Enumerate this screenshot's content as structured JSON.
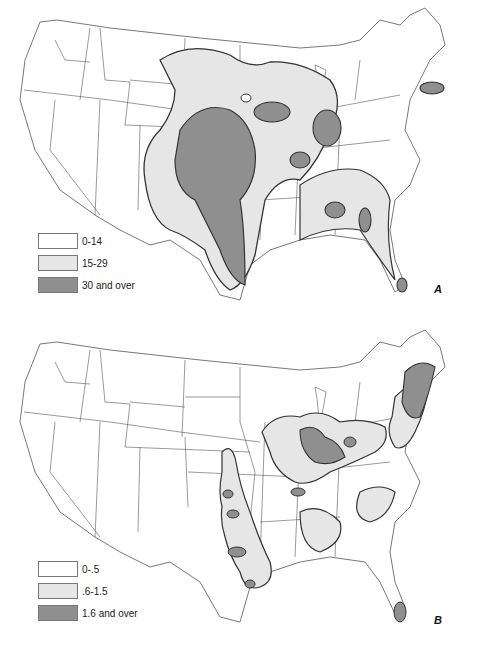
{
  "colors": {
    "low": "#ffffff",
    "mid": "#e6e6e6",
    "high": "#8f8f8f",
    "border": "#333333",
    "state_line": "#555555"
  },
  "maps": [
    {
      "letter": "A",
      "legend": [
        {
          "label": "0-14",
          "class": "low"
        },
        {
          "label": "15-29",
          "class": "mid"
        },
        {
          "label": "30 and over",
          "class": "high"
        }
      ]
    },
    {
      "letter": "B",
      "legend": [
        {
          "label": "0-.5",
          "class": "low"
        },
        {
          "label": ".6-1.5",
          "class": "mid"
        },
        {
          "label": "1.6 and over",
          "class": "high"
        }
      ]
    }
  ]
}
